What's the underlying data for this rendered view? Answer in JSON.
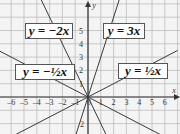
{
  "chart_data": {
    "type": "line",
    "title": "",
    "xlabel": "x",
    "ylabel": "y",
    "xlim": [
      -6,
      6
    ],
    "ylim": [
      -2,
      5
    ],
    "grid": true,
    "x_ticks": [
      "-6",
      "-5",
      "-4",
      "-3",
      "-2",
      "-1",
      "0",
      "1",
      "2",
      "3",
      "4",
      "5",
      "6"
    ],
    "y_ticks": [
      "5",
      "4",
      "3",
      "2",
      "1",
      "2"
    ],
    "series": [
      {
        "name": "y = -2x",
        "slope": -2,
        "x": [
          -3.5,
          1.2
        ],
        "y": [
          7,
          -2.4
        ]
      },
      {
        "name": "y = 3x",
        "slope": 3,
        "x": [
          -1,
          2.4
        ],
        "y": [
          -3,
          7.2
        ]
      },
      {
        "name": "y = -1/2x",
        "slope": -0.5,
        "x": [
          -7,
          7
        ],
        "y": [
          3.5,
          -3.5
        ]
      },
      {
        "name": "y = 1/2x",
        "slope": 0.5,
        "x": [
          -7,
          7
        ],
        "y": [
          -3.5,
          3.5
        ]
      }
    ],
    "annotations": [
      {
        "text": "y = −2x"
      },
      {
        "text": "y = 3x"
      },
      {
        "text": "y = −½x"
      },
      {
        "text": "y = ½x"
      }
    ]
  },
  "labels": {
    "neg2x": "y = −2x",
    "pos3x": "y = 3x",
    "neghalf": "y = −½x",
    "poshalf": "y = ½x",
    "x_axis": "x",
    "y_axis": "y"
  },
  "colors": {
    "grid": "#b8b8b8",
    "axis": "#333333",
    "line": "#444444",
    "background": "#f2f2f2"
  }
}
